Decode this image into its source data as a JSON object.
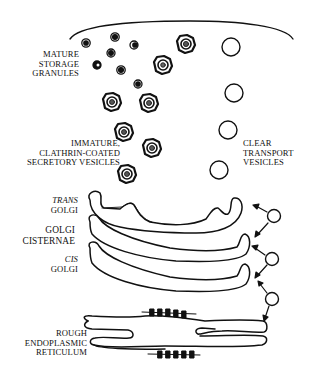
{
  "diagram": {
    "stroke_color": "#111111",
    "background": "#ffffff",
    "labels": {
      "mature_storage_granules": [
        "MATURE",
        "STORAGE",
        "GRANULES"
      ],
      "immature_vesicles": [
        "IMMATURE,",
        "CLATHRIN-COATED",
        "SECRETORY VESICLES"
      ],
      "clear_transport_vesicles": [
        "CLEAR",
        "TRANSPORT",
        "VESICLES"
      ],
      "trans_golgi": [
        "TRANS",
        "GOLGI"
      ],
      "golgi_cisternae": [
        "GOLGI",
        "CISTERNAE"
      ],
      "cis_golgi": [
        "CIS",
        "GOLGI"
      ],
      "rough_er": [
        "ROUGH",
        "ENDOPLASMIC",
        "RETICULUM"
      ]
    },
    "elements": {
      "plasma_membrane": "plasma-membrane-arc",
      "mature_granules_count": 8,
      "immature_vesicles_count": 7,
      "clear_vesicles_top_count": 4,
      "clear_vesicles_golgi_count": 3,
      "golgi_cisternae_count": 3,
      "er_ribosome_clusters": 2
    }
  }
}
